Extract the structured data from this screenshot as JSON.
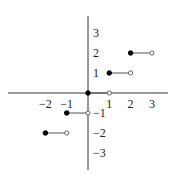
{
  "chart_data": {
    "type": "line",
    "title": "",
    "subtitle": "",
    "xlabel": "",
    "ylabel": "",
    "xlim": [
      -3,
      3.5
    ],
    "ylim": [
      -3.5,
      3.5
    ],
    "grid": false,
    "legend": null,
    "x_ticks": [
      {
        "value": -2,
        "label": "−2"
      },
      {
        "value": -1,
        "label": "−1"
      },
      {
        "value": 1,
        "label": "1"
      },
      {
        "value": 2,
        "label": "2"
      },
      {
        "value": 3,
        "label": "3"
      }
    ],
    "y_ticks": [
      {
        "value": 3,
        "label": "3"
      },
      {
        "value": 2,
        "label": "2"
      },
      {
        "value": 1,
        "label": "1"
      },
      {
        "value": -1,
        "label": "−1"
      },
      {
        "value": -2,
        "label": "−2"
      },
      {
        "value": -3,
        "label": "−3"
      }
    ],
    "segments": [
      {
        "x_start": -2,
        "x_end": -1,
        "y": -2,
        "start": "closed",
        "end": "open"
      },
      {
        "x_start": -1,
        "x_end": 0,
        "y": -1,
        "start": "closed",
        "end": "open"
      },
      {
        "x_start": 0,
        "x_end": 1,
        "y": 0,
        "start": "closed",
        "end": "open"
      },
      {
        "x_start": 1,
        "x_end": 2,
        "y": 1,
        "start": "closed",
        "end": "open"
      },
      {
        "x_start": 2,
        "x_end": 3,
        "y": 2,
        "start": "closed",
        "end": "open"
      }
    ],
    "colors": {
      "line": "#555555",
      "axis": "#333333",
      "point": "#000000"
    }
  }
}
